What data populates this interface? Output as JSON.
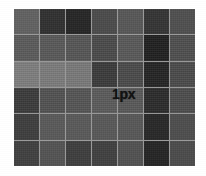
{
  "figure": {
    "background_color": "#ffffff",
    "gridline_color": "#9a9a9a",
    "annotation": {
      "label": "1px",
      "color": "#111111",
      "row": 4,
      "column": 4
    },
    "grid": {
      "columns": 7,
      "rows": 6,
      "cell_gap_px": 1,
      "panel_left_px": 14,
      "panel_top_px": 9,
      "panel_width_px": 181,
      "panel_height_px": 157
    }
  },
  "chart_data": {
    "type": "heatmap",
    "title": "",
    "xlabel": "",
    "ylabel": "",
    "columns": 7,
    "rows": 6,
    "legend": "",
    "grid": true,
    "palette": {
      "lightest": "#7d7d7d",
      "light": "#6e6e6e",
      "medium": "#5a5a5a",
      "medium_dark": "#4a4a4a",
      "dark": "#3a3a3a",
      "darker": "#2c2c2c",
      "darkest": "#1f1f1f"
    },
    "values": [
      [
        "#606060",
        "#2f2f2f",
        "#232323",
        "#4a4a4a",
        "#565656",
        "#333333",
        "#4e4e4e"
      ],
      [
        "#5a5a5a",
        "#585858",
        "#555555",
        "#4a4a4a",
        "#585858",
        "#1f1f1f",
        "#4e4e4e"
      ],
      [
        "#7d7d7d",
        "#7a7a7a",
        "#787878",
        "#3a3a3a",
        "#4a4a4a",
        "#232323",
        "#4a4a4a"
      ],
      [
        "#3a3a3a",
        "#515151",
        "#545454",
        "#5a5a5a",
        "#585858",
        "#2a2a2a",
        "#4c4c4c"
      ],
      [
        "#3c3c3c",
        "#585858",
        "#585858",
        "#575757",
        "#565656",
        "#262626",
        "#4c4c4c"
      ],
      [
        "#3e3e3e",
        "#525252",
        "#3c3c3c",
        "#3e3e3e",
        "#505050",
        "#222222",
        "#4a4a4a"
      ]
    ]
  }
}
